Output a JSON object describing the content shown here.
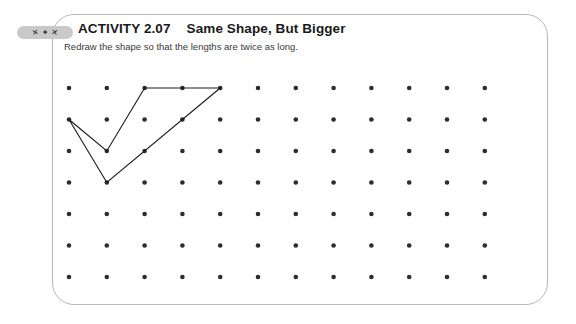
{
  "card": {
    "border_color": "#b9b9b9",
    "background": "#ffffff"
  },
  "header": {
    "badge": {
      "name": "activity-icon-badge",
      "background": "#c9c9c9",
      "glyphs": [
        "✕",
        "✦",
        "✕"
      ]
    },
    "activity_label": "ACTIVITY 2.07",
    "activity_name": "Same Shape, But Bigger",
    "instruction": "Redraw the shape so that the lengths are twice as long."
  },
  "grid": {
    "columns": 12,
    "rows": 7,
    "origin_x": 17,
    "origin_y": 20,
    "spacing_x": 37.8,
    "spacing_y": 31.5,
    "dot_radius": 2.3,
    "dot_color": "#2d2d2d"
  },
  "shape": {
    "label": "given-shape",
    "stroke_color": "#1d1d1d",
    "stroke_width": 1.15,
    "closed": true,
    "vertices_grid": [
      [
        0,
        1
      ],
      [
        1,
        2
      ],
      [
        2,
        0
      ],
      [
        4,
        0
      ],
      [
        1,
        3
      ]
    ],
    "points_svg": "17,51.5 54.8,83 92.6,20 168.2,20 54.8,114.5"
  }
}
